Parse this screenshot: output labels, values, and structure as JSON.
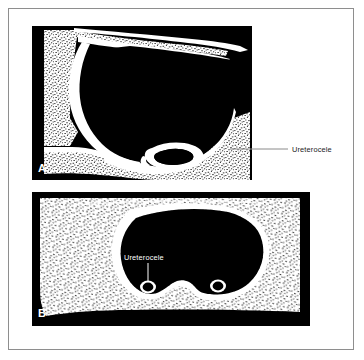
{
  "figure": {
    "background_color": "#ffffff",
    "frame_color": "#8e8e8e",
    "ink_color": "#000000",
    "lumen_color": "#000000",
    "wall_color": "#ffffff",
    "leader_color": "#8a8a8a",
    "stipple_color": "#111111"
  },
  "panels": [
    {
      "id": "panel-a",
      "letter": "A",
      "view": "longitudinal-sagittal-section",
      "letter_color": "#ffffff",
      "background_color": "#000000"
    },
    {
      "id": "panel-b",
      "letter": "B",
      "view": "transverse-axial-section",
      "letter_color": "#ffffff",
      "background_color": "#000000"
    }
  ],
  "annotations": [
    {
      "id": "annotation-a",
      "text": "Ureterocele",
      "panel": "A",
      "color": "#1a1a1a",
      "leader": "horizontal",
      "placement": "outside-right"
    },
    {
      "id": "annotation-b",
      "text": "Ureterocele",
      "panel": "B",
      "color": "#ffffff",
      "leader": "vertical",
      "placement": "inside-lumen"
    }
  ]
}
